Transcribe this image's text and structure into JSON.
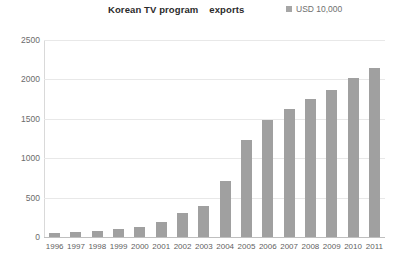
{
  "chart_data": {
    "type": "bar",
    "title": "Korean TV program    exports",
    "xlabel": "",
    "ylabel": "",
    "ylim": [
      0,
      2500
    ],
    "yticks": [
      0,
      500,
      1000,
      1500,
      2000,
      2500
    ],
    "ytick_labels": [
      "0",
      "500",
      "1000",
      "1500",
      "2000",
      "2500"
    ],
    "grid": true,
    "legend_position": "top-right",
    "legend": [
      "USD 10,000"
    ],
    "bar_color": "#a0a0a0",
    "categories": [
      "1996",
      "1997",
      "1998",
      "1999",
      "2000",
      "2001",
      "2002",
      "2003",
      "2004",
      "2005",
      "2006",
      "2007",
      "2008",
      "2009",
      "2010",
      "2011"
    ],
    "series": [
      {
        "name": "USD 10,000",
        "values": [
          55,
          60,
          80,
          100,
          130,
          190,
          300,
          390,
          710,
          1230,
          1490,
          1620,
          1750,
          1870,
          2020,
          2150
        ]
      }
    ]
  },
  "legend": {
    "marker": "square-marker-icon",
    "label": "USD 10,000"
  },
  "title": "Korean TV program    exports"
}
